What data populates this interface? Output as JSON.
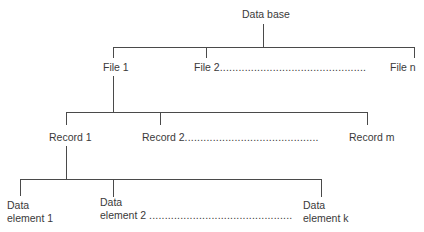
{
  "diagram": {
    "type": "hierarchy-tree",
    "root": {
      "label": "Data base"
    },
    "level1": {
      "items": [
        {
          "label": "File 1"
        },
        {
          "label": "File 2"
        },
        {
          "label": "File n"
        }
      ],
      "ellipsis": "..............................................."
    },
    "level2": {
      "items": [
        {
          "label": "Record 1"
        },
        {
          "label": "Record 2"
        },
        {
          "label": "Record m"
        }
      ],
      "ellipsis": "..........................................."
    },
    "level3": {
      "items": [
        {
          "line1": "Data",
          "line2": "element 1"
        },
        {
          "line1": "Data",
          "line2": "element 2"
        },
        {
          "line1": "Data",
          "line2": "element k"
        }
      ],
      "ellipsis": ".............................................."
    },
    "colors": {
      "line": "#4a4a4a",
      "text": "#3a3a3a",
      "background": "#ffffff"
    }
  }
}
